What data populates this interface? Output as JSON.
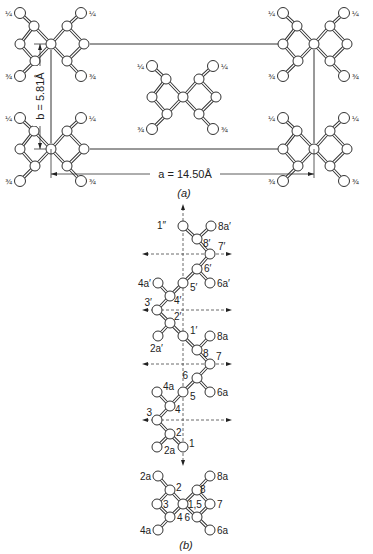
{
  "figure": {
    "part_a": {
      "caption": "(a)",
      "a_dimension": "a = 14.50Å",
      "b_dimension": "b = 5.81Å",
      "height_labels": {
        "upper": "¼",
        "lower": "¾"
      },
      "units": [
        {
          "name": "top-left",
          "cx": 51,
          "cy": 44
        },
        {
          "name": "top-right",
          "cx": 314,
          "cy": 44
        },
        {
          "name": "bottom-left",
          "cx": 51,
          "cy": 149
        },
        {
          "name": "bottom-right",
          "cx": 314,
          "cy": 149
        },
        {
          "name": "center",
          "cx": 183,
          "cy": 97
        }
      ]
    },
    "part_b": {
      "caption": "(b)",
      "chain_atoms": [
        {
          "id": "1''",
          "label": "1″",
          "x": 183,
          "y": 226,
          "lx": 166,
          "ly": 229,
          "anchor": "end"
        },
        {
          "id": "8a'",
          "label": "8a′",
          "x": 211,
          "y": 226,
          "lx": 218,
          "ly": 230,
          "anchor": "start"
        },
        {
          "id": "8'",
          "label": "8′",
          "x": 197,
          "y": 239,
          "lx": 203,
          "ly": 247,
          "anchor": "start"
        },
        {
          "id": "7'",
          "label": "7′",
          "x": 210,
          "y": 254,
          "lx": 218,
          "ly": 250,
          "anchor": "start"
        },
        {
          "id": "6'",
          "label": "6′",
          "x": 197,
          "y": 269,
          "lx": 204,
          "ly": 272,
          "anchor": "start"
        },
        {
          "id": "6a'",
          "label": "6a′",
          "x": 210,
          "y": 283,
          "lx": 217,
          "ly": 287,
          "anchor": "start"
        },
        {
          "id": "5'",
          "label": "5′",
          "x": 183,
          "y": 283,
          "lx": 190,
          "ly": 291,
          "anchor": "start"
        },
        {
          "id": "4a'",
          "label": "4a′",
          "x": 158,
          "y": 283,
          "lx": 151,
          "ly": 287,
          "anchor": "end"
        },
        {
          "id": "4'",
          "label": "4′",
          "x": 170,
          "y": 296,
          "lx": 174,
          "ly": 304,
          "anchor": "start"
        },
        {
          "id": "3'",
          "label": "3′",
          "x": 157,
          "y": 310,
          "lx": 152,
          "ly": 306,
          "anchor": "end"
        },
        {
          "id": "2'",
          "label": "2′",
          "x": 170,
          "y": 323,
          "lx": 174,
          "ly": 320,
          "anchor": "start"
        },
        {
          "id": "2a'",
          "label": "2a′",
          "x": 158,
          "y": 336,
          "lx": 150,
          "ly": 352,
          "anchor": "start"
        },
        {
          "id": "1'",
          "label": "1′",
          "x": 183,
          "y": 336,
          "lx": 190,
          "ly": 334,
          "anchor": "start"
        },
        {
          "id": "8a",
          "label": "8a",
          "x": 210,
          "y": 336,
          "lx": 217,
          "ly": 340,
          "anchor": "start"
        },
        {
          "id": "8",
          "label": "8",
          "x": 197,
          "y": 350,
          "lx": 203,
          "ly": 357,
          "anchor": "start"
        },
        {
          "id": "7",
          "label": "7",
          "x": 210,
          "y": 364,
          "lx": 216,
          "ly": 360,
          "anchor": "start"
        },
        {
          "id": "6",
          "label": "6",
          "x": 197,
          "y": 378,
          "lx": 188,
          "ly": 379,
          "anchor": "end"
        },
        {
          "id": "6a",
          "label": "6a",
          "x": 210,
          "y": 392,
          "lx": 217,
          "ly": 396,
          "anchor": "start"
        },
        {
          "id": "5",
          "label": "5",
          "x": 183,
          "y": 392,
          "lx": 190,
          "ly": 400,
          "anchor": "start"
        },
        {
          "id": "4a",
          "label": "4a",
          "x": 157,
          "y": 392,
          "lx": 163,
          "ly": 390,
          "anchor": "start"
        },
        {
          "id": "4",
          "label": "4",
          "x": 170,
          "y": 406,
          "lx": 175,
          "ly": 413,
          "anchor": "start"
        },
        {
          "id": "3",
          "label": "3",
          "x": 157,
          "y": 420,
          "lx": 152,
          "ly": 416,
          "anchor": "end"
        },
        {
          "id": "2",
          "label": "2",
          "x": 170,
          "y": 434,
          "lx": 176,
          "ly": 436,
          "anchor": "start"
        },
        {
          "id": "2a",
          "label": "2a",
          "x": 157,
          "y": 447,
          "lx": 164,
          "ly": 454,
          "anchor": "start"
        },
        {
          "id": "1",
          "label": "1",
          "x": 183,
          "y": 447,
          "lx": 189,
          "ly": 447,
          "anchor": "start"
        }
      ],
      "chain_bonds": [
        [
          "1''",
          "8'"
        ],
        [
          "8a'",
          "8'"
        ],
        [
          "8'",
          "7'"
        ],
        [
          "7'",
          "6'"
        ],
        [
          "6'",
          "5'"
        ],
        [
          "6'",
          "6a'"
        ],
        [
          "5'",
          "4'"
        ],
        [
          "4a'",
          "4'"
        ],
        [
          "4'",
          "3'"
        ],
        [
          "3'",
          "2'"
        ],
        [
          "2'",
          "1'"
        ],
        [
          "2'",
          "2a'"
        ],
        [
          "1'",
          "8"
        ],
        [
          "8a",
          "8"
        ],
        [
          "8",
          "7"
        ],
        [
          "7",
          "6"
        ],
        [
          "6",
          "5"
        ],
        [
          "6",
          "6a"
        ],
        [
          "5",
          "4"
        ],
        [
          "4a",
          "4"
        ],
        [
          "4",
          "3"
        ],
        [
          "3",
          "2"
        ],
        [
          "2",
          "1"
        ],
        [
          "2",
          "2a"
        ]
      ],
      "axis": {
        "x": 183,
        "y_top": 208,
        "y_bottom": 462
      },
      "twofold_axes_y": [
        254,
        310,
        364,
        420
      ],
      "twofold_x_range": [
        146,
        228
      ],
      "projection_atoms": [
        {
          "id": "2a",
          "label": "2a",
          "x": 158,
          "y": 476,
          "lx": 151,
          "ly": 480,
          "anchor": "end"
        },
        {
          "id": "8a",
          "label": "8a",
          "x": 210,
          "y": 476,
          "lx": 217,
          "ly": 480,
          "anchor": "start"
        },
        {
          "id": "2",
          "label": "2",
          "x": 170,
          "y": 490,
          "lx": 176,
          "ly": 491,
          "anchor": "start"
        },
        {
          "id": "8",
          "label": "8",
          "x": 197,
          "y": 490,
          "lx": 200,
          "ly": 493,
          "anchor": "start"
        },
        {
          "id": "3",
          "label": "3",
          "x": 157,
          "y": 504,
          "lx": 163,
          "ly": 508,
          "anchor": "start"
        },
        {
          "id": "1,5",
          "label": "1,5",
          "x": 183,
          "y": 504,
          "lx": 188,
          "ly": 508,
          "anchor": "start"
        },
        {
          "id": "7",
          "label": "7",
          "x": 210,
          "y": 504,
          "lx": 217,
          "ly": 508,
          "anchor": "start"
        },
        {
          "id": "4",
          "label": "4",
          "x": 170,
          "y": 517,
          "lx": 177,
          "ly": 521,
          "anchor": "start"
        },
        {
          "id": "6",
          "label": "6",
          "x": 197,
          "y": 517,
          "lx": 190,
          "ly": 521,
          "anchor": "end"
        },
        {
          "id": "4a",
          "label": "4a",
          "x": 158,
          "y": 530,
          "lx": 151,
          "ly": 534,
          "anchor": "end"
        },
        {
          "id": "6a",
          "label": "6a",
          "x": 210,
          "y": 530,
          "lx": 217,
          "ly": 534,
          "anchor": "start"
        }
      ],
      "projection_bonds": [
        [
          "2a",
          "2"
        ],
        [
          "2",
          "3"
        ],
        [
          "3",
          "4"
        ],
        [
          "4",
          "4a"
        ],
        [
          "2",
          "1,5"
        ],
        [
          "4",
          "1,5"
        ],
        [
          "8a",
          "8"
        ],
        [
          "8",
          "7"
        ],
        [
          "7",
          "6"
        ],
        [
          "6",
          "6a"
        ],
        [
          "8",
          "1,5"
        ],
        [
          "6",
          "1,5"
        ]
      ]
    }
  }
}
